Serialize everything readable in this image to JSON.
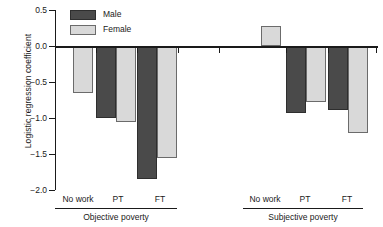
{
  "chart_data": {
    "type": "bar",
    "title": "",
    "xlabel": "",
    "ylabel": "Logistic regression coefficient",
    "ylim": [
      -2.0,
      0.5
    ],
    "yticks": [
      0.5,
      0.0,
      -0.5,
      -1.0,
      -1.5,
      -2.0
    ],
    "ytick_labels": [
      "0.5",
      "0.0",
      "−0.5",
      "−1.0",
      "−1.5",
      "−2.0"
    ],
    "grid": false,
    "legend_position": "top-left",
    "categories": [
      "No work",
      "PT",
      "FT"
    ],
    "panels": [
      {
        "name": "Objective poverty",
        "categories": [
          "No work",
          "PT",
          "FT"
        ],
        "series": [
          {
            "name": "Male",
            "color": "#4a4a4a",
            "values": [
              null,
              -1.0,
              -1.85
            ]
          },
          {
            "name": "Female",
            "color": "#d9d9d9",
            "values": [
              -0.65,
              -1.06,
              -1.55
            ]
          }
        ]
      },
      {
        "name": "Subjective poverty",
        "categories": [
          "No work",
          "PT",
          "FT"
        ],
        "series": [
          {
            "name": "Male",
            "color": "#4a4a4a",
            "values": [
              null,
              -0.93,
              -0.89
            ]
          },
          {
            "name": "Female",
            "color": "#d9d9d9",
            "values": [
              0.28,
              -0.78,
              -1.21
            ]
          }
        ]
      }
    ],
    "legend": [
      {
        "label": "Male",
        "color": "#4a4a4a"
      },
      {
        "label": "Female",
        "color": "#d9d9d9"
      }
    ]
  },
  "axis": {
    "y_title": "Logistic regression coefficient",
    "ticks": [
      {
        "label": "0.5"
      },
      {
        "label": "0.0"
      },
      {
        "label": "−0.5"
      },
      {
        "label": "−1.0"
      },
      {
        "label": "−1.5"
      },
      {
        "label": "−2.0"
      }
    ]
  },
  "legend": {
    "male_label": "Male",
    "female_label": "Female"
  },
  "panels": [
    {
      "group_label": "Objective poverty",
      "cat_labels": [
        "No work",
        "PT",
        "FT"
      ]
    },
    {
      "group_label": "Subjective poverty",
      "cat_labels": [
        "No work",
        "PT",
        "FT"
      ]
    }
  ]
}
